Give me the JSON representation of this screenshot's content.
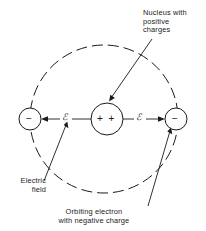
{
  "figure": {
    "background_color": "#ffffff",
    "stroke_color": "#1a1a1a"
  },
  "nucleus": {
    "label_text": "Nucleus with\npositive\ncharges",
    "charge_symbol": "+  +",
    "center_x": 107,
    "center_y": 119,
    "radius": 16
  },
  "electrons": [
    {
      "name": "left-electron",
      "charge_symbol": "−",
      "center_x": 30,
      "center_y": 119,
      "radius": 11
    },
    {
      "name": "right-electron",
      "charge_symbol": "−",
      "center_x": 176,
      "center_y": 119,
      "radius": 11
    }
  ],
  "orbit": {
    "style": "dashed",
    "center_x": 104,
    "center_y": 119,
    "radius": 74
  },
  "field_arrows": [
    {
      "name": "left-field-arrow",
      "symbol": "ℰ",
      "direction": "left"
    },
    {
      "name": "right-field-arrow",
      "symbol": "ℰ",
      "direction": "right"
    }
  ],
  "labels": {
    "nucleus": "Nucleus with\npositive\ncharges",
    "electric_field": "Electric\nfield",
    "orbiting_electron": "Orbiting electron\nwith negative charge"
  }
}
